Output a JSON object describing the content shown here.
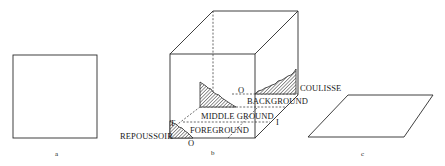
{
  "figure": {
    "panels": [
      {
        "id": "a",
        "label": "a",
        "shape": "square"
      },
      {
        "id": "b",
        "label": "b",
        "shape": "cube",
        "labels": {
          "background": "BACKGROUND",
          "middle_ground": "MIDDLE GROUND",
          "foreground": "FOREGROUND",
          "repoussoir": "REPOUSSOIR",
          "coulisse": "COULISSE",
          "o_top": "O",
          "o_bottom": "O",
          "t_mark": "T",
          "i_mark": "I"
        }
      },
      {
        "id": "c",
        "label": "c",
        "shape": "parallelogram"
      }
    ]
  }
}
